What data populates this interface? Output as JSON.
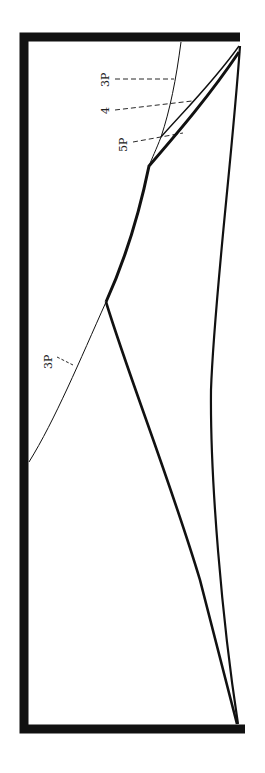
{
  "diagram": {
    "type": "phase-diagram (rotated 90°)",
    "colors": {
      "ink": "#111111",
      "background": "#ffffff"
    },
    "labels": [
      {
        "id": "label-3p-top",
        "text": "3P"
      },
      {
        "id": "label-4",
        "text": "4"
      },
      {
        "id": "label-5p",
        "text": "5P"
      },
      {
        "id": "label-3p-lower",
        "text": "3P"
      }
    ]
  }
}
